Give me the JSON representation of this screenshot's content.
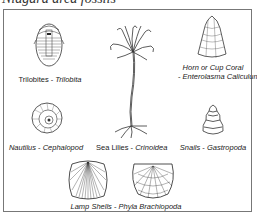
{
  "title": "Niagara area fossils",
  "fossils": [
    {
      "common": "Trilobites",
      "sep": " - ",
      "scientific": "Trilobita",
      "icon": "trilobite-icon"
    },
    {
      "common": "Sea Lilies",
      "sep": " - ",
      "scientific": "Crinoidea",
      "icon": "sea-lily-icon"
    },
    {
      "common": "Horn or Cup Coral",
      "sep": "- ",
      "scientific": "Enterolasma Caliculum",
      "icon": "horn-coral-icon"
    },
    {
      "common": "Nautilus",
      "sep": " - ",
      "scientific": "Cephalopod",
      "icon": "nautilus-icon"
    },
    {
      "common": "Snails",
      "sep": " - ",
      "scientific": "Gastropoda",
      "icon": "snail-icon"
    },
    {
      "common": "Lamp Shells",
      "sep": " - ",
      "scientific": "Phyla Brachiopoda",
      "icon": "lamp-shell-icon"
    }
  ]
}
